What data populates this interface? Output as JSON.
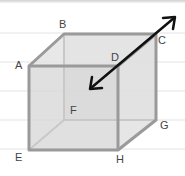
{
  "diagram": {
    "type": "cube",
    "vertices": {
      "A": {
        "label": "A",
        "x": 29,
        "y": 66
      },
      "B": {
        "label": "B",
        "x": 64,
        "y": 34
      },
      "C": {
        "label": "C",
        "x": 156,
        "y": 34
      },
      "D": {
        "label": "D",
        "x": 118,
        "y": 66
      },
      "E": {
        "label": "E",
        "x": 29,
        "y": 150
      },
      "F": {
        "label": "F",
        "x": 64,
        "y": 120
      },
      "G": {
        "label": "G",
        "x": 156,
        "y": 120
      },
      "H": {
        "label": "H",
        "x": 118,
        "y": 150
      }
    },
    "arrow": {
      "type": "double-headed",
      "from": [
        90,
        89
      ],
      "to": [
        175,
        17
      ],
      "color": "#111111"
    },
    "colors": {
      "edge": "#9a9a9a",
      "hidden_edge": "#c4c4c4",
      "face_fill": "#d9d9d9",
      "ruled_line": "#e3e3e3",
      "label": "#444444"
    }
  }
}
